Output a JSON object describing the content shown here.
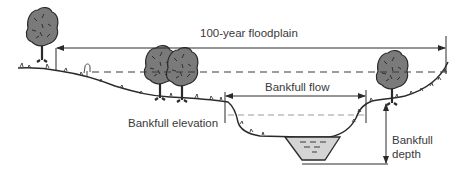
{
  "diagram": {
    "labels": {
      "floodplain": "100-year floodplain",
      "bankfull_flow": "Bankfull flow",
      "bankfull_elevation": "Bankfull elevation",
      "bankfull_depth_line1": "Bankfull",
      "bankfull_depth_line2": "depth"
    },
    "colors": {
      "line": "#2a2a2a",
      "tree_canopy": "#7a7a7a",
      "tree_dark": "#3a3a3a",
      "water": "#d4d4d4",
      "text": "#3a3a3a"
    },
    "trees": [
      {
        "name": "tree-far-left",
        "x": 40,
        "y": 12
      },
      {
        "name": "tree-left-1",
        "x": 158,
        "y": 50
      },
      {
        "name": "tree-left-2",
        "x": 182,
        "y": 52
      },
      {
        "name": "tree-right",
        "x": 388,
        "y": 55
      }
    ]
  }
}
